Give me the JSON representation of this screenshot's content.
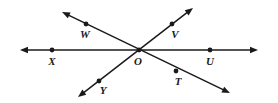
{
  "figure": {
    "type": "geometry-diagram",
    "width": 278,
    "height": 103,
    "background_color": "#ffffff",
    "stroke_color": "#1a1a1a",
    "label_color": "#1a1a1a"
  },
  "points": [
    {
      "id": "W",
      "label": "W",
      "dot_x": 86,
      "dot_y": 24,
      "label_x": 85,
      "label_y": 34
    },
    {
      "id": "V",
      "label": "V",
      "dot_x": 172,
      "dot_y": 24,
      "label_x": 175,
      "label_y": 34
    },
    {
      "id": "X",
      "label": "X",
      "dot_x": 52,
      "dot_y": 50,
      "label_x": 52,
      "label_y": 61
    },
    {
      "id": "O",
      "label": "O",
      "dot_x": 139,
      "dot_y": 50,
      "label_x": 138,
      "label_y": 61
    },
    {
      "id": "U",
      "label": "U",
      "dot_x": 210,
      "dot_y": 50,
      "label_x": 210,
      "label_y": 61
    },
    {
      "id": "T",
      "label": "T",
      "dot_x": 176,
      "dot_y": 71,
      "label_x": 178,
      "label_y": 81
    },
    {
      "id": "Y",
      "label": "Y",
      "dot_x": 99,
      "dot_y": 81,
      "label_x": 103,
      "label_y": 90
    }
  ],
  "lines": [
    {
      "id": "line-XU",
      "name": "horizontal-line",
      "through_points": [
        "X",
        "O",
        "U"
      ],
      "x1": 20,
      "y1": 50,
      "x2": 258,
      "y2": 50,
      "arrow_start": true,
      "arrow_end": true
    },
    {
      "id": "line-WT",
      "name": "line-w-to-t",
      "through_points": [
        "W",
        "O",
        "T"
      ],
      "x1": 62,
      "y1": 12,
      "x2": 230,
      "y2": 93,
      "arrow_start": true,
      "arrow_end": true
    },
    {
      "id": "line-VY",
      "name": "line-v-to-y",
      "through_points": [
        "V",
        "O",
        "Y"
      ],
      "x1": 193,
      "y1": 8,
      "x2": 78,
      "y2": 97,
      "arrow_start": true,
      "arrow_end": true
    }
  ],
  "dot_radius": 2.4,
  "line_width": 1.5
}
